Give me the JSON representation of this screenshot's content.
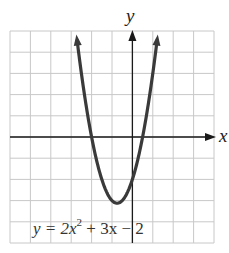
{
  "chart_data": {
    "type": "line",
    "title": "",
    "equation_label": "y = 2x² + 3x − 2",
    "equation": {
      "prefix": "y = 2x",
      "sup": "2",
      "suffix": " + 3x − 2"
    },
    "xlabel": "x",
    "ylabel": "y",
    "xlim": [
      -6,
      4
    ],
    "ylim": [
      -5,
      5
    ],
    "grid": true,
    "grid_step": 1,
    "series": [
      {
        "name": "y = 2x^2 + 3x - 2",
        "function": "2*x*x + 3*x - 2",
        "x": [
          -2.766,
          -2.5,
          -2,
          -1.5,
          -1,
          -0.75,
          -0.5,
          0,
          0.5,
          1,
          1.266
        ],
        "y": [
          5,
          3,
          0,
          -2,
          -3,
          -3.125,
          -3,
          -2,
          0,
          3,
          5
        ],
        "vertex": [
          -0.75,
          -3.125
        ],
        "roots": [
          -2,
          0.5
        ],
        "y_intercept": -2,
        "color": "#3a3a3a"
      }
    ],
    "colors": {
      "grid": "#c8c8c8",
      "axis": "#1a1a1a",
      "curve": "#3a3a3a"
    }
  }
}
